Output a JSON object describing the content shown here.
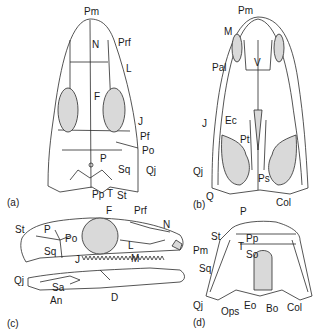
{
  "figure": {
    "panels": [
      {
        "id": "a",
        "tag": "(a)",
        "view": "dorsal",
        "labels": {
          "Pm": "Pm",
          "N": "N",
          "Prf": "Prf",
          "L": "L",
          "F": "F",
          "J": "J",
          "Pf": "Pf",
          "Po": "Po",
          "P": "P",
          "Sq": "Sq",
          "Qj": "Qj",
          "Pp": "Pp",
          "T": "T",
          "St": "St"
        }
      },
      {
        "id": "b",
        "tag": "(b)",
        "view": "palatal",
        "labels": {
          "Pm": "Pm",
          "M": "M",
          "Pal": "Pal",
          "V": "V",
          "J": "J",
          "Ec": "Ec",
          "Pt": "Pt",
          "Qj": "Qj",
          "Q": "Q",
          "Ps": "Ps",
          "Col": "Col"
        }
      },
      {
        "id": "c",
        "tag": "(c)",
        "view": "lateral",
        "labels": {
          "F": "F",
          "Prf": "Prf",
          "N": "N",
          "St": "St",
          "P": "P",
          "Po": "Po",
          "Sq": "Sq",
          "L": "L",
          "J": "J",
          "M": "M",
          "Pm": "Pm",
          "Qj": "Qj",
          "Sa": "Sa",
          "An": "An",
          "D": "D"
        }
      },
      {
        "id": "d",
        "tag": "(d)",
        "view": "occipital",
        "labels": {
          "P": "P",
          "St": "St",
          "Pp": "Pp",
          "T": "T",
          "So": "So",
          "Sq": "Sq",
          "Qj": "Qj",
          "Ops": "Ops",
          "Eo": "Eo",
          "Bo": "Bo",
          "Col": "Col"
        }
      }
    ],
    "colors": {
      "line": "#2a2a2a",
      "fill": "#d9d9d9",
      "bg": "#ffffff"
    }
  }
}
